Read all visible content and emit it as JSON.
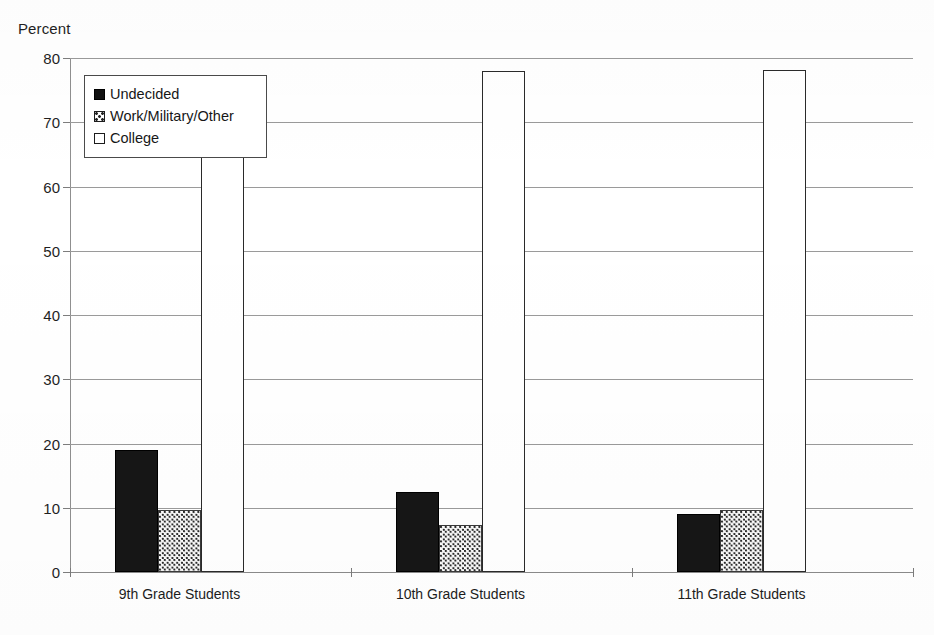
{
  "chart_data": {
    "type": "bar",
    "title": "",
    "subtitle": "",
    "xlabel": "",
    "ylabel": "Percent",
    "ylim": [
      0,
      80
    ],
    "yticks": [
      0,
      10,
      20,
      30,
      40,
      50,
      60,
      70,
      80
    ],
    "ytick_labels": [
      "0",
      "10",
      "20",
      "30",
      "40",
      "50",
      "60",
      "70",
      "80"
    ],
    "grid": true,
    "legend_position": "upper left (inside plot)",
    "categories": [
      "9th Grade Students",
      "10th Grade Students",
      "11th Grade Students"
    ],
    "series": [
      {
        "name": "Undecided",
        "fill": "solid-black",
        "color": "#161616",
        "values": [
          19.0,
          12.5,
          9.0
        ]
      },
      {
        "name": "Work/Military/Other",
        "fill": "dotted-stipple",
        "color": "#d9d9d9",
        "values": [
          9.7,
          7.3,
          9.7
        ]
      },
      {
        "name": "College",
        "fill": "white-outline",
        "color": "#ffffff",
        "values": [
          71.0,
          78.0,
          78.2
        ]
      }
    ],
    "annotations": []
  },
  "axis": {
    "y_title": "Percent"
  },
  "legend": {
    "items": [
      {
        "label": "Undecided",
        "swatch": "solid-black-swatch"
      },
      {
        "label": "Work/Military/Other",
        "swatch": "stipple-swatch"
      },
      {
        "label": "College",
        "swatch": "white-outline-swatch"
      }
    ]
  }
}
